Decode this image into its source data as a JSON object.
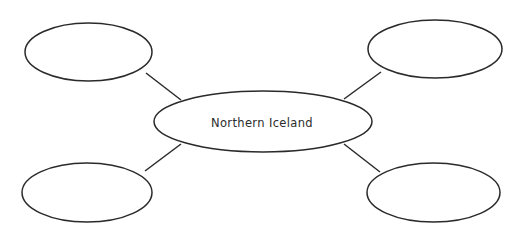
{
  "diagram": {
    "kind": "bubble-concept-map",
    "title_text": "Northern Iceland",
    "background_color": "#ffffff",
    "stroke_color": "#2a2a2a",
    "stroke_width": 1.5,
    "text_color": "#2b2b2b",
    "center": {
      "name": "center-bubble",
      "label": "Northern Iceland",
      "cx": 263,
      "cy": 121.5,
      "rx": 109,
      "ry": 30.5,
      "label_x": 262,
      "label_y": 123
    },
    "branches": [
      {
        "name": "bubble-top-left",
        "label": "",
        "cx": 88.5,
        "cy": 52,
        "rx": 63.5,
        "ry": 29,
        "line": {
          "x1": 146,
          "y1": 73,
          "x2": 181,
          "y2": 100
        }
      },
      {
        "name": "bubble-top-right",
        "label": "",
        "cx": 435,
        "cy": 49,
        "rx": 67,
        "ry": 29,
        "line": {
          "x1": 381,
          "y1": 72,
          "x2": 344,
          "y2": 99
        }
      },
      {
        "name": "bubble-bottom-left",
        "label": "",
        "cx": 87,
        "cy": 192.5,
        "rx": 65,
        "ry": 29.5,
        "line": {
          "x1": 145,
          "y1": 171,
          "x2": 181,
          "y2": 144
        }
      },
      {
        "name": "bubble-bottom-right",
        "label": "",
        "cx": 433.5,
        "cy": 192.5,
        "rx": 66.5,
        "ry": 29.5,
        "line": {
          "x1": 380,
          "y1": 172,
          "x2": 344,
          "y2": 144
        }
      }
    ]
  }
}
